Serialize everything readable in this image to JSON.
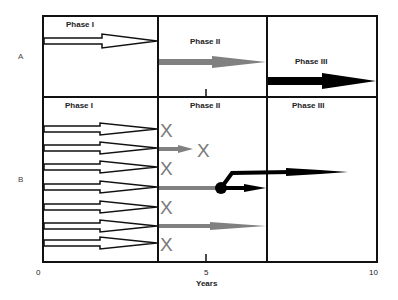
{
  "diagram": {
    "rows": [
      {
        "label": "A",
        "phases": [
          "Phase I",
          "Phase II",
          "Phase III"
        ]
      },
      {
        "label": "B",
        "phases": [
          "Phase I",
          "Phase II",
          "Phase III"
        ]
      }
    ],
    "axis": {
      "xlabel": "Years",
      "ticks": [
        "0",
        "5",
        "10"
      ]
    },
    "x_mark": "X",
    "colors": {
      "border": "#111111",
      "phase1_arrow": "#ffffff",
      "phase2_arrow": "#808080",
      "phase3_arrow": "#000000",
      "x_mark": "#7a7a7a"
    },
    "row_b_outcomes": [
      {
        "arrow": 1,
        "result": "X"
      },
      {
        "arrow": 2,
        "result": "short gray arrow then X"
      },
      {
        "arrow": 3,
        "result": "X"
      },
      {
        "arrow": 4,
        "result": "gray arrow to branch point; black arrows continue"
      },
      {
        "arrow": 5,
        "result": "X"
      },
      {
        "arrow": 6,
        "result": "gray arrow to end of Phase II"
      },
      {
        "arrow": 7,
        "result": "X"
      }
    ]
  }
}
